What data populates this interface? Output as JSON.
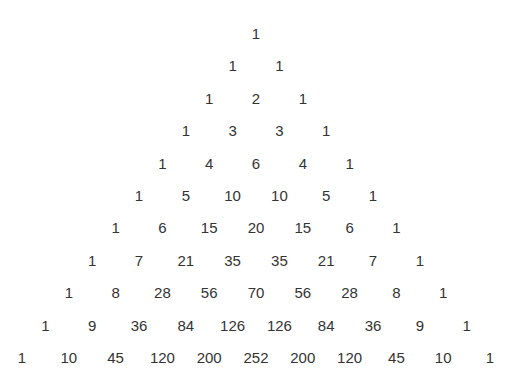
{
  "layout": {
    "center_x": 256,
    "top_y": 33,
    "row_spacing": 32.4,
    "col_spacing": 23.4
  },
  "rows": [
    [
      "1"
    ],
    [
      "1",
      "1"
    ],
    [
      "1",
      "2",
      "1"
    ],
    [
      "1",
      "3",
      "3",
      "1"
    ],
    [
      "1",
      "4",
      "6",
      "4",
      "1"
    ],
    [
      "1",
      "5",
      "10",
      "10",
      "5",
      "1"
    ],
    [
      "1",
      "6",
      "15",
      "20",
      "15",
      "6",
      "1"
    ],
    [
      "1",
      "7",
      "21",
      "35",
      "35",
      "21",
      "7",
      "1"
    ],
    [
      "1",
      "8",
      "28",
      "56",
      "70",
      "56",
      "28",
      "8",
      "1"
    ],
    [
      "1",
      "9",
      "36",
      "84",
      "126",
      "126",
      "84",
      "36",
      "9",
      "1"
    ],
    [
      "1",
      "10",
      "45",
      "120",
      "200",
      "252",
      "200",
      "120",
      "45",
      "10",
      "1"
    ]
  ]
}
